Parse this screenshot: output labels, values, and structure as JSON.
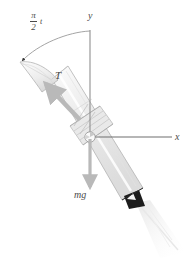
{
  "figure": {
    "type": "physics-free-body-diagram",
    "background_color": "#ffffff"
  },
  "axes": {
    "x_label": "x",
    "y_label": "y",
    "origin_marker": "center-of-mass circle",
    "x_axis": {
      "from": [
        90,
        137
      ],
      "to": [
        173,
        137
      ]
    },
    "y_axis": {
      "from": [
        90,
        30
      ],
      "to": [
        90,
        137
      ]
    },
    "color": "#8a8a8a"
  },
  "vectors": [
    {
      "name": "thrust",
      "label": "T",
      "direction": "up-left along rocket body axis",
      "color": "#b9b9b9"
    },
    {
      "name": "weight",
      "label": "mg",
      "direction": "straight down from center of mass",
      "color": "#b9b9b9"
    }
  ],
  "angle_annotation": {
    "label_numerator": "π",
    "label_denominator": "2",
    "label_variable": "t",
    "full_label": "π/2 t",
    "description": "arc from y-axis to rocket axis with arrowhead at rocket nose",
    "color": "#9a9a9a"
  },
  "rocket": {
    "tilt_degrees": 40,
    "body_fill": "#efefef",
    "body_stroke": "#b0b0b0",
    "nozzle_color": "#1c1c1c",
    "exhaust_color": "#f2f2f2",
    "fins_color": "#d8d8d8"
  }
}
